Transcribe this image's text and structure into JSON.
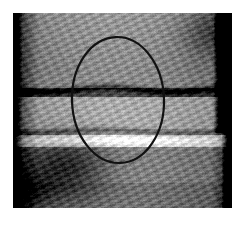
{
  "figure": {
    "kind": "annotated-photograph",
    "medium": "grayscale photograph",
    "caption": "",
    "border": {
      "style": "solid white mat",
      "color": "#ffffff",
      "inset_px": 13
    },
    "photo": {
      "x": 13,
      "y": 13,
      "width": 219,
      "height": 195,
      "palette": {
        "deep_shadow": "#0a0a0a",
        "shadow": "#2b2b2b",
        "midtone_dark": "#4d4d4d",
        "midtone": "#6e6e6e",
        "midtone_light": "#909090",
        "highlight": "#c2c2c2",
        "specular": "#ececec"
      }
    },
    "annotation": {
      "name": "region-of-interest-ellipse",
      "shape": "ellipse",
      "stroke_color": "#111111",
      "stroke_width_px": 2.2,
      "center_x": 118,
      "center_y": 100,
      "radius_x": 46,
      "radius_y": 63,
      "rotation_deg": -2,
      "label": ""
    },
    "features": [
      {
        "name": "upper-horizontal-seam",
        "y": 75,
        "description": "dark horizontal joint line crossing full width"
      },
      {
        "name": "lower-horizontal-seam",
        "y": 118,
        "description": "secondary joint line below the central band"
      },
      {
        "name": "bright-highlight-band",
        "y": 126,
        "description": "specular highlight running left to right"
      },
      {
        "name": "left-shadow-column",
        "x": 18,
        "description": "very dark vertical band along the left edge"
      },
      {
        "name": "right-shadow-column",
        "x": 222,
        "description": "very dark vertical band along the right edge"
      },
      {
        "name": "lower-left-dark-blotch",
        "x": 60,
        "y": 165,
        "description": "large dark stain in the lower-left quadrant"
      },
      {
        "name": "diagonal-tooling-striations",
        "description": "fine diagonal scratch/tool marks across the surface"
      }
    ]
  }
}
